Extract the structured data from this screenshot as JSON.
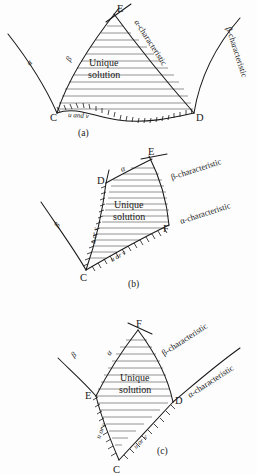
{
  "figure": {
    "title_alt": "Domains of determinacy for characteristic boundary value problems",
    "background_color": "#fdfdfd",
    "ink_color": "#1a1a1a",
    "hatch_color": "#6f6f6f"
  },
  "labels": {
    "unique_line1": "Unique",
    "unique_line2": "solution",
    "alpha": "α",
    "beta": "β",
    "alpha_characteristic": "α-characteristic",
    "beta_characteristic": "β-characteristic",
    "u_and_v": "u and v",
    "u_or_v": "u or v",
    "point_C": "C",
    "point_D": "D",
    "point_E": "E",
    "point_F": "F"
  },
  "panels": [
    {
      "id": "a",
      "caption": "(a)",
      "vertices": [
        "C",
        "D",
        "E"
      ],
      "boundary_data_label": "u and v",
      "boundary_type": "non-characteristic initial curve CD",
      "characteristics": [
        "α-characteristic",
        "β-characteristic"
      ],
      "region_label": "Unique solution"
    },
    {
      "id": "b",
      "caption": "(b)",
      "vertices": [
        "C",
        "D",
        "E",
        "F"
      ],
      "boundary_data_label": "u or v",
      "boundary_type": "two characteristic arcs CD and CF",
      "characteristics": [
        "α-characteristic",
        "β-characteristic"
      ],
      "region_label": "Unique solution"
    },
    {
      "id": "c",
      "caption": "(c)",
      "vertices": [
        "C",
        "D",
        "E",
        "F"
      ],
      "boundary_data_label": "u or v",
      "boundary_type": "two characteristic arcs CE and CD",
      "characteristics": [
        "α-characteristic",
        "β-characteristic"
      ],
      "region_label": "Unique solution"
    }
  ]
}
